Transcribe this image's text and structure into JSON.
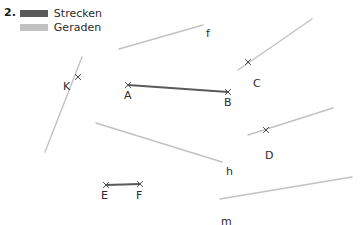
{
  "exercise": {
    "number": "2."
  },
  "legend": {
    "items": [
      {
        "label": "Strecken",
        "color": "#5a5a5a",
        "swatch_name": "segment-swatch"
      },
      {
        "label": "Geraden",
        "color": "#c2c2c2",
        "swatch_name": "line-swatch"
      }
    ]
  },
  "colors": {
    "segment": "#5a5a5a",
    "line": "#c2c2c2",
    "marker": "#4a4a4a",
    "text": "#2b2b2b"
  },
  "chart_data": {
    "type": "scatter",
    "title": "",
    "xlabel": "",
    "ylabel": "",
    "xlim": [
      0,
      363
    ],
    "ylim": [
      225,
      0
    ],
    "grid": false,
    "legend_position": "top-left",
    "series": [
      {
        "name": "Strecken",
        "kind": "segment",
        "color": "#5a5a5a",
        "width": 2,
        "items": [
          {
            "label": "AB",
            "endpoints": [
              {
                "label": "A",
                "x": 128,
                "y": 85
              },
              {
                "label": "B",
                "x": 228,
                "y": 92
              }
            ],
            "label_positions": [
              {
                "label": "A",
                "x": 124,
                "y": 90
              },
              {
                "label": "B",
                "x": 224,
                "y": 97
              }
            ]
          },
          {
            "label": "EF",
            "endpoints": [
              {
                "label": "E",
                "x": 106,
                "y": 185
              },
              {
                "label": "F",
                "x": 140,
                "y": 184
              }
            ],
            "label_positions": [
              {
                "label": "E",
                "x": 101,
                "y": 190
              },
              {
                "label": "F",
                "x": 136,
                "y": 190
              }
            ]
          }
        ]
      },
      {
        "name": "Geraden",
        "kind": "line",
        "color": "#c2c2c2",
        "width": 1.4,
        "items": [
          {
            "label": "f",
            "from": {
              "x": 119,
              "y": 49
            },
            "to": {
              "x": 203,
              "y": 25
            },
            "label_position": {
              "x": 206,
              "y": 28
            },
            "points": []
          },
          {
            "label": "",
            "name": "line-through-c",
            "from": {
              "x": 238,
              "y": 70
            },
            "to": {
              "x": 312,
              "y": 19
            },
            "label_position": null,
            "points": [
              {
                "label": "C",
                "x": 248,
                "y": 62,
                "label_x": 253,
                "label_y": 78
              }
            ]
          },
          {
            "label": "",
            "name": "line-through-k",
            "from": {
              "x": 45,
              "y": 152
            },
            "to": {
              "x": 82,
              "y": 57
            },
            "label_position": null,
            "points": [
              {
                "label": "K",
                "x": 78,
                "y": 77,
                "label_x": 63,
                "label_y": 81
              }
            ]
          },
          {
            "label": "",
            "name": "line-through-d",
            "from": {
              "x": 248,
              "y": 135
            },
            "to": {
              "x": 333,
              "y": 108
            },
            "label_position": null,
            "points": [
              {
                "label": "D",
                "x": 266,
                "y": 130,
                "label_x": 265,
                "label_y": 150
              }
            ]
          },
          {
            "label": "h",
            "from": {
              "x": 96,
              "y": 123
            },
            "to": {
              "x": 222,
              "y": 162
            },
            "label_position": {
              "x": 226,
              "y": 166
            },
            "points": []
          },
          {
            "label": "m",
            "from": {
              "x": 220,
              "y": 199
            },
            "to": {
              "x": 352,
              "y": 177
            },
            "label_position": {
              "x": 221,
              "y": 216
            },
            "points": []
          }
        ]
      }
    ]
  }
}
